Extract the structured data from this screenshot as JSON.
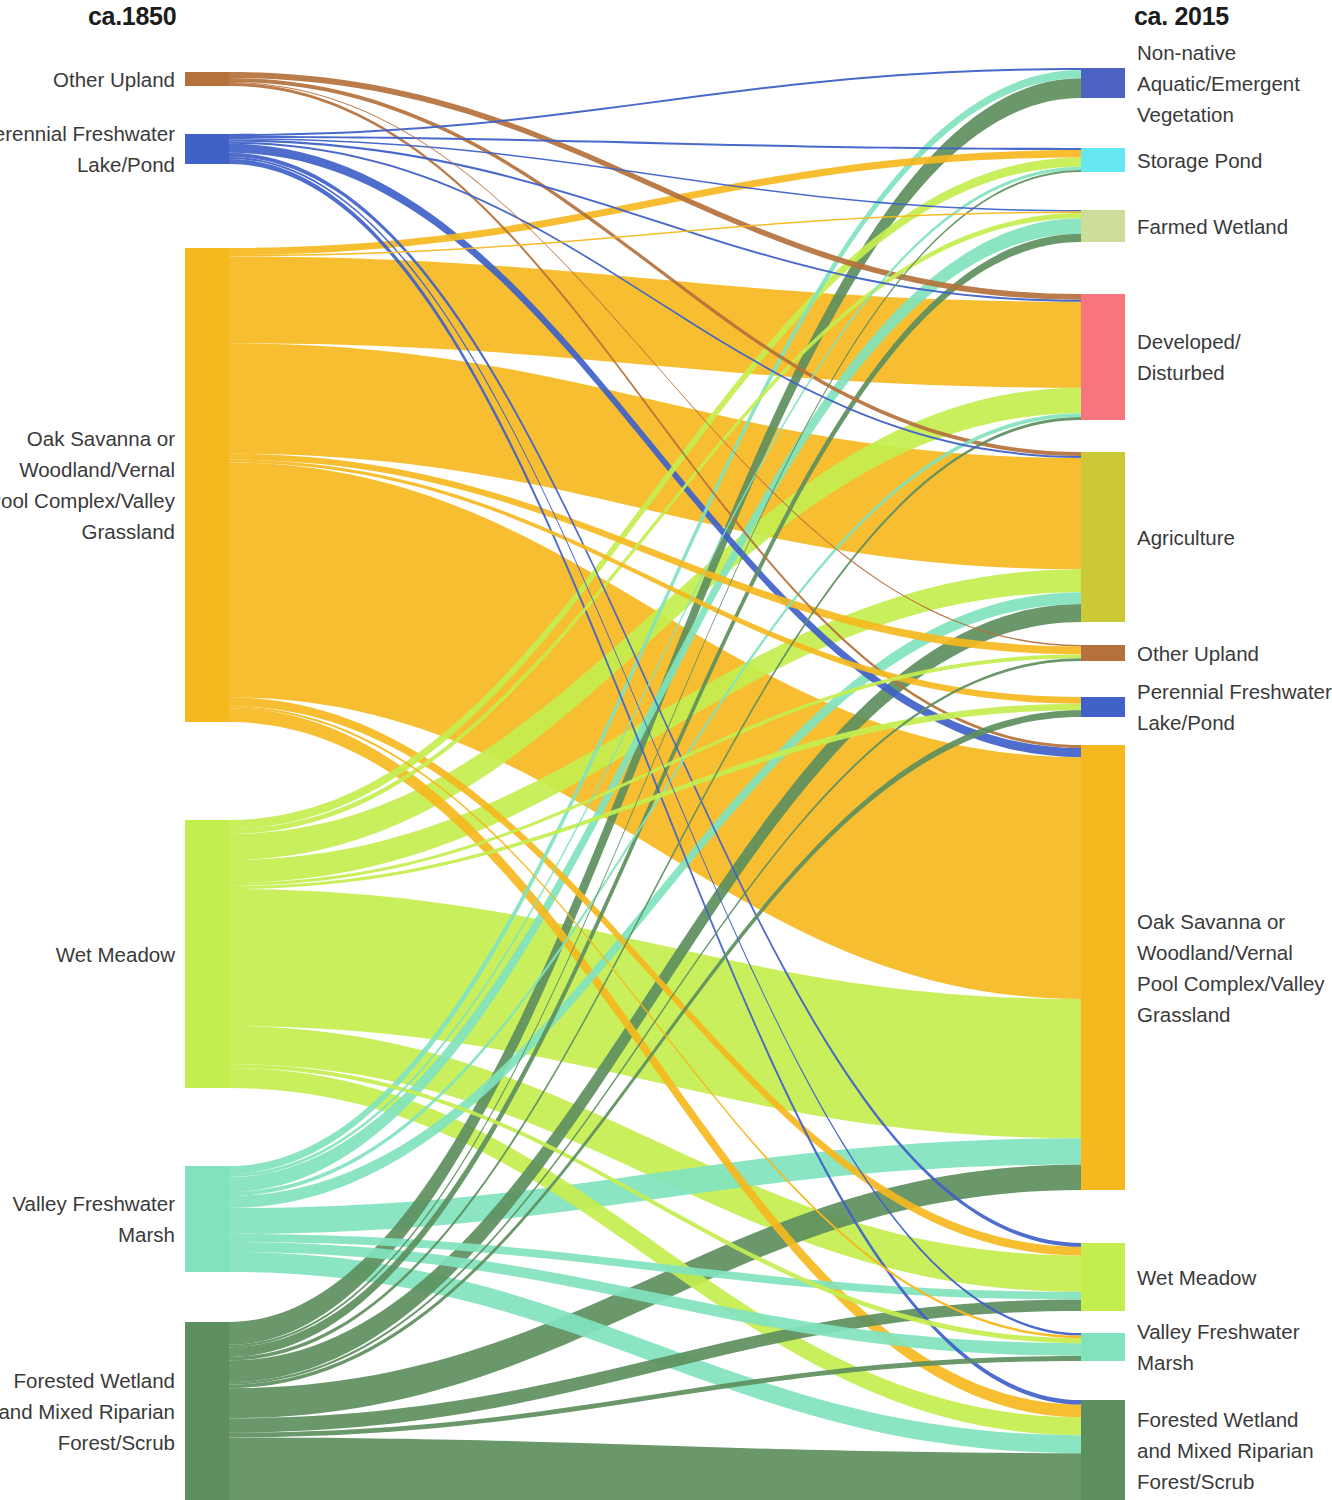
{
  "titles": {
    "left": "ca.1850",
    "right": "ca. 2015"
  },
  "colors": {
    "other_upland": "#B5713C",
    "perennial_lake": "#3F61C8",
    "oak_savanna": "#F5B81E",
    "wet_meadow": "#C4EE4F",
    "valley_marsh": "#81E3BE",
    "forested_wetland": "#5D8F5E",
    "nonnative_aquatic": "#4C63C4",
    "storage_pond": "#66E8F0",
    "farmed_wetland": "#CCDE9A",
    "developed": "#F9757E",
    "agriculture": "#CBC936"
  },
  "chart_data": {
    "type": "sankey",
    "left_axis_label": "ca.1850",
    "right_axis_label": "ca. 2015",
    "units": "relative area",
    "nodes_left": [
      {
        "id": "L_other_upland",
        "label": "Other Upland",
        "color_key": "other_upland",
        "y": 72,
        "height": 14,
        "value": 14
      },
      {
        "id": "L_perennial_lake",
        "label": "Perennial Freshwater\nLake/Pond",
        "color_key": "perennial_lake",
        "y": 134,
        "height": 30,
        "value": 30
      },
      {
        "id": "L_oak_savanna",
        "label": "Oak Savanna or\nWoodland/Vernal\nPool Complex/Valley\nGrassland",
        "color_key": "oak_savanna",
        "y": 248,
        "height": 474,
        "value": 474
      },
      {
        "id": "L_wet_meadow",
        "label": "Wet Meadow",
        "color_key": "wet_meadow",
        "y": 820,
        "height": 268,
        "value": 268
      },
      {
        "id": "L_valley_marsh",
        "label": "Valley Freshwater\nMarsh",
        "color_key": "valley_marsh",
        "y": 1166,
        "height": 106,
        "value": 106
      },
      {
        "id": "L_forested_wetland",
        "label": "Forested Wetland\nand Mixed Riparian\nForest/Scrub",
        "color_key": "forested_wetland",
        "y": 1322,
        "height": 178,
        "value": 178
      }
    ],
    "nodes_right": [
      {
        "id": "R_nonnative_aquatic",
        "label": "Non-native\nAquatic/Emergent\nVegetation",
        "color_key": "nonnative_aquatic",
        "y": 68,
        "height": 30,
        "value": 30
      },
      {
        "id": "R_storage_pond",
        "label": "Storage Pond",
        "color_key": "storage_pond",
        "y": 148,
        "height": 24,
        "value": 24
      },
      {
        "id": "R_farmed_wetland",
        "label": "Farmed Wetland",
        "color_key": "farmed_wetland",
        "y": 210,
        "height": 32,
        "value": 32
      },
      {
        "id": "R_developed",
        "label": "Developed/\nDisturbed",
        "color_key": "developed",
        "y": 294,
        "height": 126,
        "value": 126
      },
      {
        "id": "R_agriculture",
        "label": "Agriculture",
        "color_key": "agriculture",
        "y": 452,
        "height": 170,
        "value": 170
      },
      {
        "id": "R_other_upland",
        "label": "Other Upland",
        "color_key": "other_upland",
        "y": 645,
        "height": 16,
        "value": 16
      },
      {
        "id": "R_perennial_lake",
        "label": "Perennial Freshwater\nLake/Pond",
        "color_key": "perennial_lake",
        "y": 697,
        "height": 20,
        "value": 20
      },
      {
        "id": "R_oak_savanna",
        "label": "Oak Savanna or\nWoodland/Vernal\nPool Complex/Valley\nGrassland",
        "color_key": "oak_savanna",
        "y": 745,
        "height": 445,
        "value": 445
      },
      {
        "id": "R_wet_meadow",
        "label": "Wet Meadow",
        "color_key": "wet_meadow",
        "y": 1243,
        "height": 68,
        "value": 68
      },
      {
        "id": "R_valley_marsh",
        "label": "Valley Freshwater\nMarsh",
        "color_key": "valley_marsh",
        "y": 1333,
        "height": 28,
        "value": 28
      },
      {
        "id": "R_forested_wetland",
        "label": "Forested Wetland\nand Mixed Riparian\nForest/Scrub",
        "color_key": "forested_wetland",
        "y": 1400,
        "height": 100,
        "value": 100
      }
    ],
    "links": [
      {
        "source": "L_other_upland",
        "target": "R_developed",
        "value": 6,
        "color_key": "other_upland"
      },
      {
        "source": "L_other_upland",
        "target": "R_agriculture",
        "value": 4,
        "color_key": "other_upland"
      },
      {
        "source": "L_other_upland",
        "target": "R_oak_savanna",
        "value": 3,
        "color_key": "other_upland"
      },
      {
        "source": "L_other_upland",
        "target": "R_other_upland",
        "value": 1,
        "color_key": "other_upland"
      },
      {
        "source": "L_perennial_lake",
        "target": "R_nonnative_aquatic",
        "value": 2,
        "color_key": "perennial_lake"
      },
      {
        "source": "L_perennial_lake",
        "target": "R_storage_pond",
        "value": 2,
        "color_key": "perennial_lake"
      },
      {
        "source": "L_perennial_lake",
        "target": "R_farmed_wetland",
        "value": 1.5,
        "color_key": "perennial_lake"
      },
      {
        "source": "L_perennial_lake",
        "target": "R_developed",
        "value": 2,
        "color_key": "perennial_lake"
      },
      {
        "source": "L_perennial_lake",
        "target": "R_agriculture",
        "value": 2,
        "color_key": "perennial_lake"
      },
      {
        "source": "L_perennial_lake",
        "target": "R_oak_savanna",
        "value": 9,
        "color_key": "perennial_lake"
      },
      {
        "source": "L_perennial_lake",
        "target": "R_wet_meadow",
        "value": 4,
        "color_key": "perennial_lake"
      },
      {
        "source": "L_perennial_lake",
        "target": "R_valley_marsh",
        "value": 2,
        "color_key": "perennial_lake"
      },
      {
        "source": "L_perennial_lake",
        "target": "R_forested_wetland",
        "value": 5,
        "color_key": "perennial_lake"
      },
      {
        "source": "L_oak_savanna",
        "target": "R_storage_pond",
        "value": 7,
        "color_key": "oak_savanna"
      },
      {
        "source": "L_oak_savanna",
        "target": "R_farmed_wetland",
        "value": 1.5,
        "color_key": "oak_savanna"
      },
      {
        "source": "L_oak_savanna",
        "target": "R_developed",
        "value": 88,
        "color_key": "oak_savanna"
      },
      {
        "source": "L_oak_savanna",
        "target": "R_agriculture",
        "value": 112,
        "color_key": "oak_savanna"
      },
      {
        "source": "L_oak_savanna",
        "target": "R_other_upland",
        "value": 6,
        "color_key": "oak_savanna"
      },
      {
        "source": "L_oak_savanna",
        "target": "R_perennial_lake",
        "value": 3,
        "color_key": "oak_savanna"
      },
      {
        "source": "L_oak_savanna",
        "target": "R_oak_savanna",
        "value": 238,
        "color_key": "oak_savanna"
      },
      {
        "source": "L_oak_savanna",
        "target": "R_wet_meadow",
        "value": 9,
        "color_key": "oak_savanna"
      },
      {
        "source": "L_oak_savanna",
        "target": "R_valley_marsh",
        "value": 2,
        "color_key": "oak_savanna"
      },
      {
        "source": "L_oak_savanna",
        "target": "R_forested_wetland",
        "value": 14,
        "color_key": "oak_savanna"
      },
      {
        "source": "L_wet_meadow",
        "target": "R_storage_pond",
        "value": 9,
        "color_key": "wet_meadow"
      },
      {
        "source": "L_wet_meadow",
        "target": "R_farmed_wetland",
        "value": 5,
        "color_key": "wet_meadow"
      },
      {
        "source": "L_wet_meadow",
        "target": "R_developed",
        "value": 26,
        "color_key": "wet_meadow"
      },
      {
        "source": "L_wet_meadow",
        "target": "R_agriculture",
        "value": 23,
        "color_key": "wet_meadow"
      },
      {
        "source": "L_wet_meadow",
        "target": "R_other_upland",
        "value": 3,
        "color_key": "wet_meadow"
      },
      {
        "source": "L_wet_meadow",
        "target": "R_perennial_lake",
        "value": 3,
        "color_key": "wet_meadow"
      },
      {
        "source": "L_wet_meadow",
        "target": "R_oak_savanna",
        "value": 137,
        "color_key": "wet_meadow"
      },
      {
        "source": "L_wet_meadow",
        "target": "R_wet_meadow",
        "value": 38,
        "color_key": "wet_meadow"
      },
      {
        "source": "L_wet_meadow",
        "target": "R_valley_marsh",
        "value": 4,
        "color_key": "wet_meadow"
      },
      {
        "source": "L_wet_meadow",
        "target": "R_forested_wetland",
        "value": 20,
        "color_key": "wet_meadow"
      },
      {
        "source": "L_valley_marsh",
        "target": "R_nonnative_aquatic",
        "value": 8,
        "color_key": "valley_marsh"
      },
      {
        "source": "L_valley_marsh",
        "target": "R_storage_pond",
        "value": 3,
        "color_key": "valley_marsh"
      },
      {
        "source": "L_valley_marsh",
        "target": "R_farmed_wetland",
        "value": 15,
        "color_key": "valley_marsh"
      },
      {
        "source": "L_valley_marsh",
        "target": "R_developed",
        "value": 4,
        "color_key": "valley_marsh"
      },
      {
        "source": "L_valley_marsh",
        "target": "R_agriculture",
        "value": 12,
        "color_key": "valley_marsh"
      },
      {
        "source": "L_valley_marsh",
        "target": "R_oak_savanna",
        "value": 26,
        "color_key": "valley_marsh"
      },
      {
        "source": "L_valley_marsh",
        "target": "R_wet_meadow",
        "value": 8,
        "color_key": "valley_marsh"
      },
      {
        "source": "L_valley_marsh",
        "target": "R_valley_marsh",
        "value": 10,
        "color_key": "valley_marsh"
      },
      {
        "source": "L_valley_marsh",
        "target": "R_forested_wetland",
        "value": 20,
        "color_key": "valley_marsh"
      },
      {
        "source": "L_forested_wetland",
        "target": "R_nonnative_aquatic",
        "value": 19,
        "color_key": "forested_wetland"
      },
      {
        "source": "L_forested_wetland",
        "target": "R_storage_pond",
        "value": 2,
        "color_key": "forested_wetland"
      },
      {
        "source": "L_forested_wetland",
        "target": "R_farmed_wetland",
        "value": 8,
        "color_key": "forested_wetland"
      },
      {
        "source": "L_forested_wetland",
        "target": "R_developed",
        "value": 3,
        "color_key": "forested_wetland"
      },
      {
        "source": "L_forested_wetland",
        "target": "R_agriculture",
        "value": 18,
        "color_key": "forested_wetland"
      },
      {
        "source": "L_forested_wetland",
        "target": "R_other_upland",
        "value": 2,
        "color_key": "forested_wetland"
      },
      {
        "source": "L_forested_wetland",
        "target": "R_perennial_lake",
        "value": 3,
        "color_key": "forested_wetland"
      },
      {
        "source": "L_forested_wetland",
        "target": "R_oak_savanna",
        "value": 25,
        "color_key": "forested_wetland"
      },
      {
        "source": "L_forested_wetland",
        "target": "R_wet_meadow",
        "value": 12,
        "color_key": "forested_wetland"
      },
      {
        "source": "L_forested_wetland",
        "target": "R_valley_marsh",
        "value": 4,
        "color_key": "forested_wetland"
      },
      {
        "source": "L_forested_wetland",
        "target": "R_forested_wetland",
        "value": 52,
        "color_key": "forested_wetland"
      }
    ],
    "layout": {
      "left_node_x": 185,
      "right_node_x": 1081,
      "node_width": 44,
      "canvas_width": 1323,
      "canvas_height": 1500
    }
  }
}
